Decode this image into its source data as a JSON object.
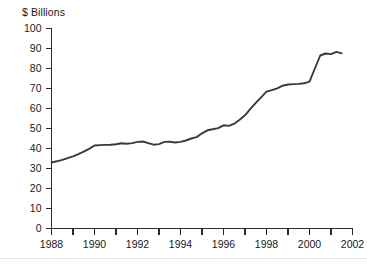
{
  "figure": {
    "background_color": "#ffffff",
    "line_color": "#3a3a3a",
    "axis_color": "#2b2b2b"
  },
  "chart_data": {
    "type": "line",
    "title": "",
    "subtitle": "",
    "ylabel": "$ Billions",
    "xlabel": "",
    "legend": [],
    "legend_position": "none",
    "grid": false,
    "ylim": [
      0,
      100
    ],
    "xlim": [
      1988,
      2002
    ],
    "ytick_labels": [
      "0",
      "10",
      "20",
      "30",
      "40",
      "50",
      "60",
      "70",
      "80",
      "90",
      "100"
    ],
    "yticks": [
      0,
      10,
      20,
      30,
      40,
      50,
      60,
      70,
      80,
      90,
      100
    ],
    "xticks": [
      1988,
      1989,
      1990,
      1991,
      1992,
      1993,
      1994,
      1995,
      1996,
      1997,
      1998,
      1999,
      2000,
      2001,
      2002
    ],
    "xtick_labels": [
      "1988",
      "",
      "1990",
      "",
      "1992",
      "",
      "1994",
      "",
      "1996",
      "",
      "1998",
      "",
      "2000",
      "",
      "2002"
    ],
    "x": [
      1988.0,
      1988.25,
      1988.5,
      1988.75,
      1989.0,
      1989.25,
      1989.5,
      1989.75,
      1990.0,
      1990.25,
      1990.5,
      1990.75,
      1991.0,
      1991.25,
      1991.5,
      1991.75,
      1992.0,
      1992.25,
      1992.5,
      1992.75,
      1993.0,
      1993.25,
      1993.5,
      1993.75,
      1994.0,
      1994.25,
      1994.5,
      1994.75,
      1995.0,
      1995.25,
      1995.5,
      1995.75,
      1996.0,
      1996.25,
      1996.5,
      1996.75,
      1997.0,
      1997.25,
      1997.5,
      1997.75,
      1998.0,
      1998.25,
      1998.5,
      1998.75,
      1999.0,
      1999.25,
      1999.5,
      1999.75,
      2000.0,
      2000.25,
      2000.5,
      2000.75,
      2001.0,
      2001.25,
      2001.5
    ],
    "values": [
      33.0,
      33.6,
      34.3,
      35.2,
      36.1,
      37.2,
      38.4,
      39.8,
      41.5,
      41.7,
      41.8,
      41.9,
      42.1,
      42.6,
      42.4,
      42.7,
      43.3,
      43.5,
      42.7,
      41.9,
      42.2,
      43.3,
      43.4,
      43.0,
      43.3,
      44.0,
      45.0,
      45.7,
      47.6,
      49.1,
      49.6,
      50.2,
      51.6,
      51.3,
      52.4,
      54.4,
      56.6,
      59.8,
      62.8,
      65.6,
      68.4,
      69.2,
      70.1,
      71.4,
      72.0,
      72.2,
      72.3,
      72.6,
      73.4,
      80.0,
      86.5,
      87.5,
      87.2,
      88.3,
      87.6
    ],
    "series": [
      {
        "name": "",
        "values": [
          33.0,
          33.6,
          34.3,
          35.2,
          36.1,
          37.2,
          38.4,
          39.8,
          41.5,
          41.7,
          41.8,
          41.9,
          42.1,
          42.6,
          42.4,
          42.7,
          43.3,
          43.5,
          42.7,
          41.9,
          42.2,
          43.3,
          43.4,
          43.0,
          43.3,
          44.0,
          45.0,
          45.7,
          47.6,
          49.1,
          49.6,
          50.2,
          51.6,
          51.3,
          52.4,
          54.4,
          56.6,
          59.8,
          62.8,
          65.6,
          68.4,
          69.2,
          70.1,
          71.4,
          72.0,
          72.2,
          72.3,
          72.6,
          73.4,
          80.0,
          86.5,
          87.5,
          87.2,
          88.3,
          87.6
        ]
      }
    ],
    "annotations": []
  }
}
